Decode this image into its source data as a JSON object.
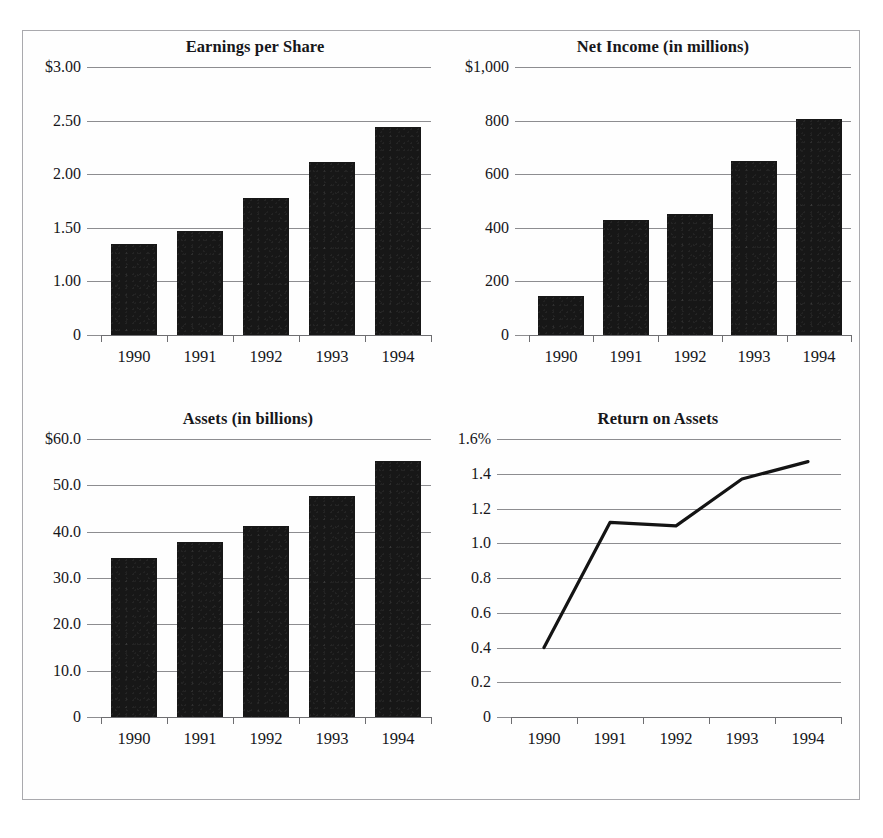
{
  "page": {
    "cut_caption": "",
    "years": [
      "1990",
      "1991",
      "1992",
      "1993",
      "1994"
    ],
    "bar_color": "#171717",
    "grid_color": "#8d8d90",
    "text_color": "#16161a",
    "border_color": "#a9a9ad",
    "background": "#ffffff"
  },
  "chart_data": [
    {
      "type": "bar",
      "id": "earnings-per-share",
      "title": "Earnings per Share",
      "xlabel": "",
      "ylabel": "",
      "categories": [
        "1990",
        "1991",
        "1992",
        "1993",
        "1994"
      ],
      "values": [
        1.35,
        1.47,
        1.78,
        2.11,
        2.44
      ],
      "ylim": [
        0,
        3.0
      ],
      "yticks": [
        3.0,
        2.5,
        2.0,
        1.5,
        1.0,
        0
      ],
      "ytick_labels": [
        "$3.00",
        "2.50",
        "2.00",
        "1.50",
        "1.00",
        "0"
      ],
      "grid": true,
      "legend": "none"
    },
    {
      "type": "bar",
      "id": "net-income",
      "title": "Net Income (in millions)",
      "xlabel": "",
      "ylabel": "",
      "categories": [
        "1990",
        "1991",
        "1992",
        "1993",
        "1994"
      ],
      "values": [
        145,
        430,
        452,
        650,
        805
      ],
      "ylim": [
        0,
        1000
      ],
      "yticks": [
        1000,
        800,
        600,
        400,
        200,
        0
      ],
      "ytick_labels": [
        "$1,000",
        "800",
        "600",
        "400",
        "200",
        "0"
      ],
      "grid": true,
      "legend": "none"
    },
    {
      "type": "bar",
      "id": "assets",
      "title": "Assets (in billions)",
      "xlabel": "",
      "ylabel": "",
      "categories": [
        "1990",
        "1991",
        "1992",
        "1993",
        "1994"
      ],
      "values": [
        34.3,
        37.8,
        41.3,
        47.7,
        55.3
      ],
      "ylim": [
        0,
        60
      ],
      "yticks": [
        60,
        50,
        40,
        30,
        20,
        10,
        0
      ],
      "ytick_labels": [
        "$60.0",
        "50.0",
        "40.0",
        "30.0",
        "20.0",
        "10.0",
        "0"
      ],
      "grid": true,
      "legend": "none"
    },
    {
      "type": "line",
      "id": "return-on-assets",
      "title": "Return on Assets",
      "xlabel": "",
      "ylabel": "",
      "categories": [
        "1990",
        "1991",
        "1992",
        "1993",
        "1994"
      ],
      "values": [
        0.4,
        1.12,
        1.1,
        1.37,
        1.47
      ],
      "ylim": [
        0,
        1.6
      ],
      "yticks": [
        1.6,
        1.4,
        1.2,
        1.0,
        0.8,
        0.6,
        0.4,
        0.2,
        0
      ],
      "ytick_labels": [
        "1.6%",
        "1.4",
        "1.2",
        "1.0",
        "0.8",
        "0.6",
        "0.4",
        "0.2",
        "0"
      ],
      "grid": true,
      "legend": "none"
    }
  ]
}
